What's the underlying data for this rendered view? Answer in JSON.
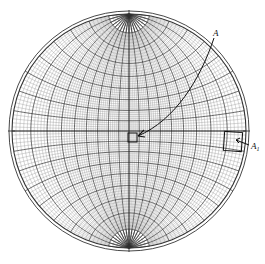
{
  "diagram": {
    "type": "wulff-stereographic-net",
    "center": [
      129,
      131
    ],
    "radius": 117,
    "outer_ring_radius": 120,
    "fine_interval_deg": 2,
    "bold_interval_deg": 10,
    "colors": {
      "background": "#ffffff",
      "fine_line": "#8a8a8a",
      "bold_line": "#2a2a2a",
      "rim": "#333333",
      "annotation": "#111111"
    }
  },
  "annotations": {
    "label_a": "A",
    "label_a1_main": "A",
    "label_a1_sub": "1",
    "center_box": {
      "x": 128,
      "y": 133,
      "size": 9
    },
    "edge_box": {
      "x": 224,
      "y": 132,
      "w": 18,
      "h": 19
    }
  }
}
